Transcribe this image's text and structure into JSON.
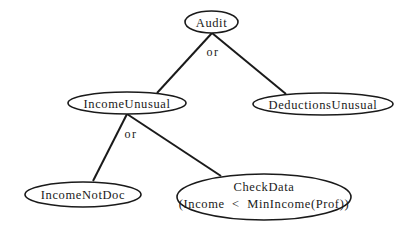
{
  "diagram": {
    "type": "and-or tree",
    "nodes": {
      "audit": {
        "label": "Audit"
      },
      "income_unusual": {
        "label": "IncomeUnusual"
      },
      "deductions_unusual": {
        "label": "DeductionsUnusual"
      },
      "income_not_doc": {
        "label": "IncomeNotDoc"
      },
      "check_data": {
        "label_line1": "CheckData",
        "label_line2": "(Income  <  MinIncome(Prof))"
      }
    },
    "operators": {
      "audit_op": "or",
      "income_unusual_op": "or"
    },
    "edges": [
      {
        "from": "Audit",
        "to": "IncomeUnusual"
      },
      {
        "from": "Audit",
        "to": "DeductionsUnusual"
      },
      {
        "from": "IncomeUnusual",
        "to": "IncomeNotDoc"
      },
      {
        "from": "IncomeUnusual",
        "to": "CheckData"
      }
    ]
  }
}
